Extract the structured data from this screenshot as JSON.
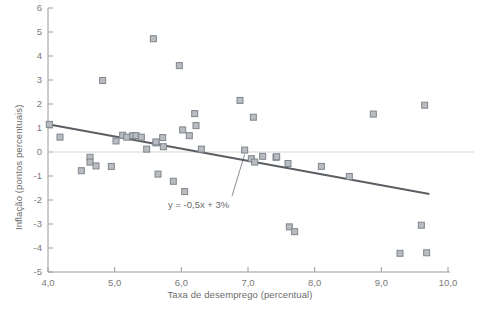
{
  "chart_data": {
    "type": "scatter",
    "title": "",
    "xlabel": "Taxa de desemprego (percentual)",
    "ylabel": "Inflação (pontos percentuais)",
    "xlim": [
      4.0,
      10.0
    ],
    "ylim": [
      -5,
      6
    ],
    "xticks": [
      4.0,
      5.0,
      6.0,
      7.0,
      8.0,
      9.0,
      10.0
    ],
    "xtick_labels": [
      "4,0",
      "5,0",
      "6,0",
      "7,0",
      "8,0",
      "9,0",
      "10,0"
    ],
    "yticks": [
      6,
      5,
      4,
      3,
      2,
      1,
      0,
      -1,
      -2,
      -3,
      -4,
      -5
    ],
    "ytick_labels": [
      "6",
      "5",
      "4",
      "3",
      "2",
      "1",
      "0",
      "-1",
      "-2",
      "-3",
      "-4",
      "-5"
    ],
    "grid": false,
    "zero_line": true,
    "legend": "none",
    "annotations": [
      {
        "name": "trendline-equation",
        "text": "y = -0,5x + 3%",
        "x": 6.85,
        "y": -2.0,
        "leader_to_x": 6.95,
        "leader_to_y": -0.1
      }
    ],
    "trendline": {
      "name": "regression-line",
      "equation": "y = -0,5x + 3%",
      "slope": -0.5,
      "intercept": 3.0,
      "color": "#5b5f64",
      "x_start": 4.02,
      "y_start": 1.15,
      "x_end": 9.72,
      "y_end": -1.75
    },
    "marker_style": {
      "shape": "square",
      "fill": "#b9bcc0",
      "edge": "#7f858c",
      "size": 6
    },
    "points": [
      {
        "x": 4.02,
        "y": 1.15
      },
      {
        "x": 4.18,
        "y": 0.62
      },
      {
        "x": 4.5,
        "y": -0.78
      },
      {
        "x": 4.63,
        "y": -0.22
      },
      {
        "x": 4.63,
        "y": -0.42
      },
      {
        "x": 4.72,
        "y": -0.58
      },
      {
        "x": 4.82,
        "y": 2.98
      },
      {
        "x": 4.95,
        "y": -0.6
      },
      {
        "x": 5.02,
        "y": 0.46
      },
      {
        "x": 5.12,
        "y": 0.7
      },
      {
        "x": 5.18,
        "y": 0.62
      },
      {
        "x": 5.27,
        "y": 0.68
      },
      {
        "x": 5.32,
        "y": 0.68
      },
      {
        "x": 5.4,
        "y": 0.62
      },
      {
        "x": 5.48,
        "y": 0.12
      },
      {
        "x": 5.58,
        "y": 4.72
      },
      {
        "x": 5.62,
        "y": 0.38
      },
      {
        "x": 5.62,
        "y": 0.42
      },
      {
        "x": 5.65,
        "y": -0.92
      },
      {
        "x": 5.72,
        "y": 0.6
      },
      {
        "x": 5.73,
        "y": 0.22
      },
      {
        "x": 5.88,
        "y": -1.22
      },
      {
        "x": 5.97,
        "y": 3.6
      },
      {
        "x": 6.02,
        "y": 0.92
      },
      {
        "x": 6.05,
        "y": -1.65
      },
      {
        "x": 6.12,
        "y": 0.68
      },
      {
        "x": 6.2,
        "y": 1.6
      },
      {
        "x": 6.22,
        "y": 1.1
      },
      {
        "x": 6.3,
        "y": 0.12
      },
      {
        "x": 6.88,
        "y": 2.15
      },
      {
        "x": 6.95,
        "y": 0.08
      },
      {
        "x": 7.05,
        "y": -0.28
      },
      {
        "x": 7.08,
        "y": 1.45
      },
      {
        "x": 7.1,
        "y": -0.42
      },
      {
        "x": 7.22,
        "y": -0.18
      },
      {
        "x": 7.42,
        "y": -0.22
      },
      {
        "x": 7.43,
        "y": -0.2
      },
      {
        "x": 7.6,
        "y": -0.48
      },
      {
        "x": 7.62,
        "y": -3.12
      },
      {
        "x": 7.7,
        "y": -3.32
      },
      {
        "x": 8.1,
        "y": -0.6
      },
      {
        "x": 8.52,
        "y": -1.02
      },
      {
        "x": 8.88,
        "y": 1.58
      },
      {
        "x": 9.28,
        "y": -4.22
      },
      {
        "x": 9.6,
        "y": -3.05
      },
      {
        "x": 9.65,
        "y": 1.95
      },
      {
        "x": 9.68,
        "y": -4.2
      }
    ]
  },
  "colors": {
    "marker_fill": "#b9bcc0",
    "marker_edge": "#7f858c",
    "trendline": "#5b5f64",
    "axis": "#9a9a9a",
    "zero_line": "#d5d5d5",
    "text": "#6b6b6b",
    "background": "#ffffff"
  }
}
